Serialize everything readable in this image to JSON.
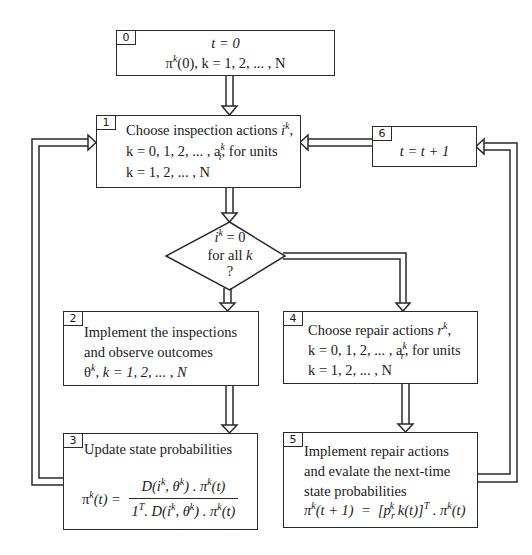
{
  "diagram": {
    "type": "flowchart",
    "colors": {
      "stroke": "#2a2a2a",
      "background": "#ffffff",
      "text": "#1a1a1a"
    },
    "nodes": {
      "box0": {
        "number": "0",
        "line1": "t = 0",
        "line2_pi": "π",
        "line2_sup": "k",
        "line2_rest": "(0), k = 1, 2, ... , N"
      },
      "box1": {
        "number": "1",
        "line1_text": "Choose inspection actions ",
        "line1_var": "i",
        "line1_sup": "k",
        "line1_end": ",",
        "line2_start": "k = 0, 1, 2, ... , a",
        "line2_sup": "k",
        "line2_sub": "i",
        "line2_end": ", for units",
        "line3": "k = 1, 2, ... , N"
      },
      "decision": {
        "line1_var": "i",
        "line1_sup": "k",
        "line1_rest": " = 0",
        "line2": "for all ",
        "line2_var": "k",
        "line3": "?"
      },
      "box2": {
        "number": "2",
        "line1": "Implement the inspections",
        "line2": "and observe outcomes",
        "line3_theta": "θ",
        "line3_sup": "k",
        "line3_rest": ", k = 1, 2, ... , N"
      },
      "box3": {
        "number": "3",
        "title": "Update state probabilities",
        "lhs": "π",
        "lhs_sup": "k",
        "lhs_rest": "(t)  =",
        "numerator": "D(i^k, θ^k) . π^k(t)",
        "denominator": "1^T. D(i^k, θ^k) . π^k(t)"
      },
      "box4": {
        "number": "4",
        "line1_text": "Choose repair actions ",
        "line1_var": "r",
        "line1_sup": "k",
        "line1_end": ",",
        "line2_start": "k = 0, 1, 2, ... , a",
        "line2_sup": "k",
        "line2_sub": "r",
        "line2_end": ", for units",
        "line3": "k = 1, 2, ... , N"
      },
      "box5": {
        "number": "5",
        "line1": "Implement repair actions",
        "line2": "and evalate the next-time",
        "line3": "state probabilities",
        "equation": "π^k(t + 1)  =  [p_r^k k(t)]^T . π^k(t)"
      },
      "box6": {
        "number": "6",
        "line1": "t  =  t + 1"
      }
    },
    "edges": [
      {
        "from": "box0",
        "to": "box1"
      },
      {
        "from": "box1",
        "to": "decision"
      },
      {
        "from": "decision",
        "to": "box2",
        "label": ""
      },
      {
        "from": "decision",
        "to": "box4",
        "label": ""
      },
      {
        "from": "box2",
        "to": "box3"
      },
      {
        "from": "box3",
        "to": "box1"
      },
      {
        "from": "box4",
        "to": "box5"
      },
      {
        "from": "box5",
        "to": "box6"
      },
      {
        "from": "box6",
        "to": "box1"
      }
    ]
  }
}
